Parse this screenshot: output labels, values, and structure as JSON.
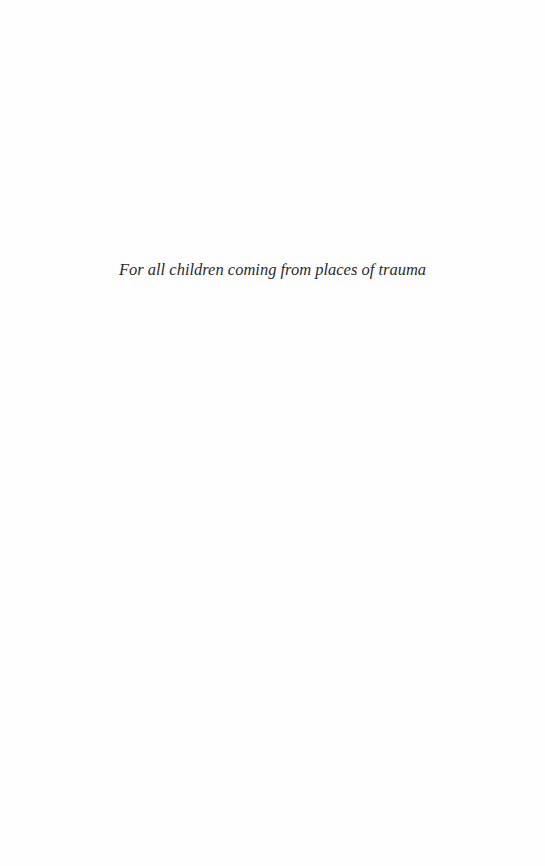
{
  "page": {
    "background_color": "#fefefe",
    "text_color": "#2b2b2b"
  },
  "dedication": {
    "text": "For all children coming from places of trauma"
  }
}
